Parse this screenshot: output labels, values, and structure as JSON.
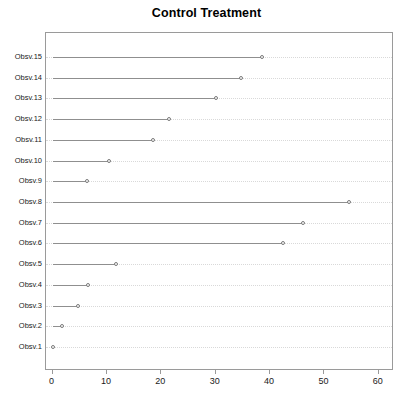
{
  "chart_data": {
    "type": "line",
    "title": "Control Treatment",
    "xlabel": "",
    "ylabel": "",
    "xlim": [
      -1.2,
      62.8
    ],
    "grid": true,
    "legend": null,
    "orientation": "horizontal",
    "categories": [
      "Obsv.1",
      "Obsv.2",
      "Obsv.3",
      "Obsv.4",
      "Obsv.5",
      "Obsv.6",
      "Obsv.7",
      "Obsv.8",
      "Obsv.9",
      "Obsv.10",
      "Obsv.11",
      "Obsv.12",
      "Obsv.13",
      "Obsv.14",
      "Obsv.15"
    ],
    "series": [
      {
        "name": "Control",
        "values": [
          0,
          0,
          0,
          0,
          0,
          0,
          0,
          0,
          0,
          0,
          0,
          0,
          0,
          0,
          0
        ]
      },
      {
        "name": "Treatment",
        "values": [
          0.0,
          1.8,
          4.6,
          6.6,
          11.6,
          42.3,
          46.0,
          54.6,
          6.3,
          10.4,
          18.4,
          21.4,
          30.0,
          34.7,
          38.5
        ]
      }
    ],
    "xticks": [
      0,
      10,
      20,
      30,
      40,
      50,
      60
    ],
    "xticklabels": [
      "0",
      "10",
      "20",
      "30",
      "40",
      "50",
      "60"
    ],
    "colors": {
      "line": "#8f8f8f",
      "marker_edge": "#7a7a7a",
      "grid": "#d9d9d9",
      "frame": "#9a9a9a",
      "text": "#1a1a1a",
      "title": "#000000",
      "background": "#ffffff"
    }
  }
}
